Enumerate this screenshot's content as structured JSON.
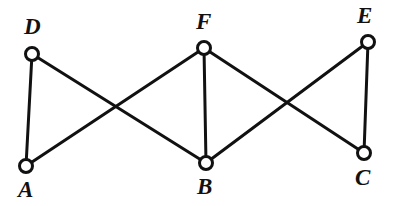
{
  "figure": {
    "background_color": "#ffffff",
    "stroke_color": "#111111",
    "vertex_fill_color": "#ffffff",
    "width": 393,
    "height": 206
  },
  "graph": {
    "vertices": [
      {
        "id": "D",
        "label": "D",
        "cx": 32,
        "cy": 54,
        "r": 6.5,
        "label_x": 24,
        "label_y": 15
      },
      {
        "id": "F",
        "label": "F",
        "cx": 204,
        "cy": 48,
        "r": 6.5,
        "label_x": 196,
        "label_y": 10
      },
      {
        "id": "E",
        "label": "E",
        "cx": 368,
        "cy": 42,
        "r": 6.5,
        "label_x": 357,
        "label_y": 4
      },
      {
        "id": "A",
        "label": "A",
        "cx": 26,
        "cy": 166,
        "r": 6.5,
        "label_x": 18,
        "label_y": 178
      },
      {
        "id": "B",
        "label": "B",
        "cx": 206,
        "cy": 163,
        "r": 6.5,
        "label_x": 197,
        "label_y": 175
      },
      {
        "id": "C",
        "label": "C",
        "cx": 364,
        "cy": 153,
        "r": 6.5,
        "label_x": 355,
        "label_y": 166
      }
    ],
    "edges": [
      {
        "id": "D-A",
        "from": "D",
        "to": "A"
      },
      {
        "id": "D-B",
        "from": "D",
        "to": "B"
      },
      {
        "id": "A-F",
        "from": "A",
        "to": "F"
      },
      {
        "id": "F-B",
        "from": "F",
        "to": "B"
      },
      {
        "id": "F-C",
        "from": "F",
        "to": "C"
      },
      {
        "id": "B-E",
        "from": "B",
        "to": "E"
      },
      {
        "id": "E-C",
        "from": "E",
        "to": "C"
      }
    ],
    "crossings": [
      {
        "id": "crossing-left",
        "x": 115,
        "y": 106
      },
      {
        "id": "crossing-right",
        "x": 288,
        "y": 106
      }
    ],
    "edge_stroke_width": 3,
    "vertex_stroke_width": 3
  }
}
